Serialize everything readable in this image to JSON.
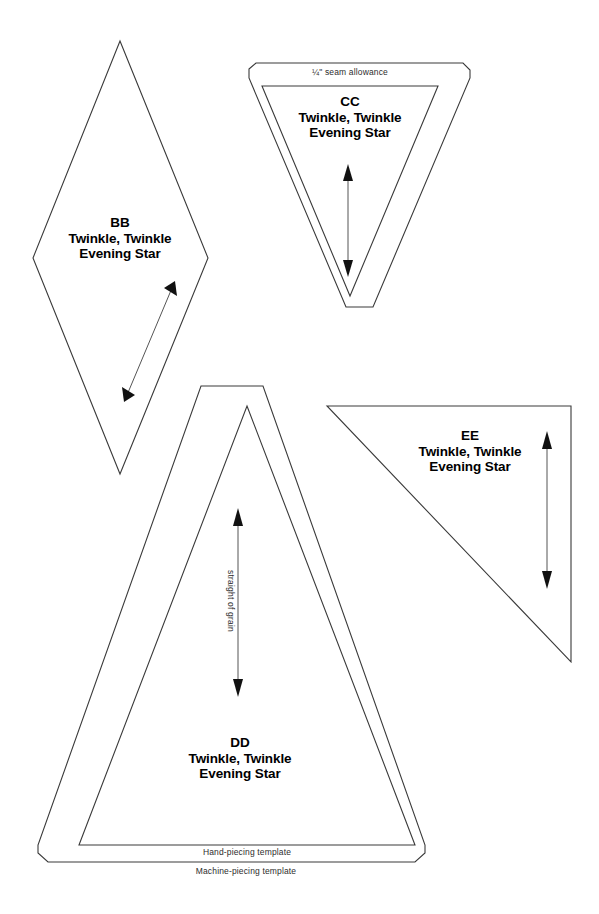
{
  "page": {
    "background_color": "#ffffff",
    "line_color": "#3a3a3a",
    "text_color": "#000000",
    "width": 599,
    "height": 914
  },
  "templates": [
    {
      "id": "BB",
      "code": "BB",
      "pattern_line1": "Twinkle, Twinkle",
      "pattern_line2": "Evening Star",
      "shape": "diamond",
      "grain_arrow": "diagonal-double",
      "has_seam_allowance_outline": false
    },
    {
      "id": "CC",
      "code": "CC",
      "pattern_line1": "Twinkle, Twinkle",
      "pattern_line2": "Evening Star",
      "shape": "inverted-triangle",
      "grain_arrow": "vertical-double",
      "has_seam_allowance_outline": true
    },
    {
      "id": "DD",
      "code": "DD",
      "pattern_line1": "Twinkle, Twinkle",
      "pattern_line2": "Evening Star",
      "shape": "triangle",
      "grain_arrow": "vertical-double",
      "has_seam_allowance_outline": true
    },
    {
      "id": "EE",
      "code": "EE",
      "pattern_line1": "Twinkle, Twinkle",
      "pattern_line2": "Evening Star",
      "shape": "right-triangle",
      "grain_arrow": "vertical-double",
      "has_seam_allowance_outline": false
    }
  ],
  "annotations": {
    "seam_allowance": "¼\" seam allowance",
    "straight_of_grain": "straight of grain",
    "hand_piecing": "Hand-piecing template",
    "machine_piecing": "Machine-piecing template"
  }
}
